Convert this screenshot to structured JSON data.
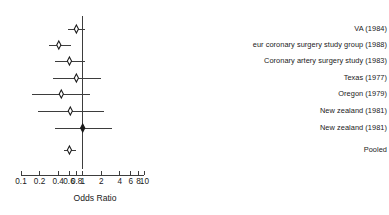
{
  "chart_data": {
    "type": "forest",
    "title": "",
    "xlabel": "Odds Ratio",
    "ylabel": "",
    "xscale": "log",
    "xlim": [
      0.1,
      10
    ],
    "grid": false,
    "null_line": 1,
    "tick_labels": [
      "0.1",
      "0.2",
      "0.4",
      "0.6",
      "0.8",
      "1",
      "2",
      "4",
      "6",
      "8",
      "10"
    ],
    "tick_values": [
      0.1,
      0.2,
      0.4,
      0.6,
      0.8,
      1,
      2,
      4,
      6,
      8,
      10
    ],
    "categories": [
      "VA (1984)",
      "eur coronary surgery study group (1988)",
      "Coronary artery surgery study (1983)",
      "Texas (1977)",
      "Oregon (1979)",
      "New zealand (1981)",
      "New zealand (1981)",
      "Pooled"
    ],
    "rows": [
      {
        "label": "VA (1984)",
        "or": 0.79,
        "ci_low": 0.58,
        "ci_high": 1.08,
        "marker": "diamond-open",
        "pooled": false
      },
      {
        "label": "eur coronary surgery study group (1988)",
        "or": 0.41,
        "ci_low": 0.28,
        "ci_high": 0.64,
        "marker": "diamond-open",
        "pooled": false
      },
      {
        "label": "Coronary artery surgery study (1983)",
        "or": 0.61,
        "ci_low": 0.35,
        "ci_high": 1.07,
        "marker": "diamond-open",
        "pooled": false
      },
      {
        "label": "Texas (1977)",
        "or": 0.79,
        "ci_low": 0.33,
        "ci_high": 2.0,
        "marker": "diamond-open",
        "pooled": false
      },
      {
        "label": "Oregon (1979)",
        "or": 0.45,
        "ci_low": 0.15,
        "ci_high": 1.3,
        "marker": "diamond-open",
        "pooled": false
      },
      {
        "label": "New zealand (1981)",
        "or": 0.63,
        "ci_low": 0.19,
        "ci_high": 2.2,
        "marker": "diamond-open",
        "pooled": false
      },
      {
        "label": "New zealand (1981)",
        "or": 1.0,
        "ci_low": 0.35,
        "ci_high": 3.0,
        "marker": "diamond-filled",
        "pooled": false
      },
      {
        "label": "Pooled",
        "or": 0.61,
        "ci_low": 0.49,
        "ci_high": 0.78,
        "marker": "diamond-open",
        "pooled": true
      }
    ],
    "colors": {
      "line": "#3d3d3d",
      "marker_stroke": "#1a1a1a",
      "marker_fill": "#ffffff",
      "text": "#1a1a1a",
      "background": "#ffffff"
    }
  }
}
